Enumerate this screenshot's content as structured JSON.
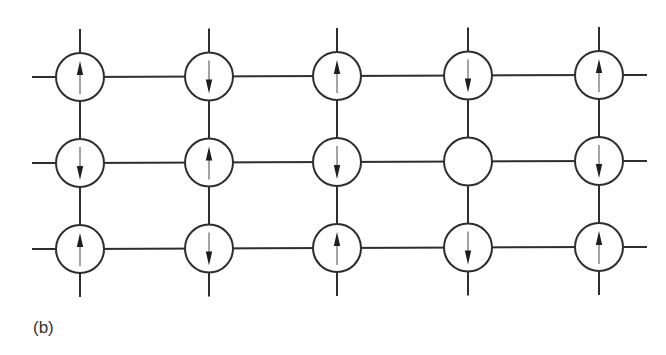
{
  "figure": {
    "panel_label": "(b)",
    "colors": {
      "line": "#2e2e2e",
      "arrow_head": "#1e1e1e",
      "background": "#ffffff"
    },
    "lattice": {
      "rows": 3,
      "columns": 5,
      "column_x": [
        80,
        209,
        337,
        468,
        599
      ],
      "row_y": [
        77,
        163,
        249
      ],
      "row_tilt_per_column": [
        0,
        -0.5,
        -1,
        -1.5,
        -2
      ],
      "site_radius": 24,
      "stub_length": 24,
      "spins": [
        [
          "up",
          "down",
          "up",
          "down",
          "up"
        ],
        [
          "down",
          "up",
          "down",
          "empty",
          "down"
        ],
        [
          "up",
          "down",
          "up",
          "down",
          "up"
        ]
      ]
    }
  }
}
